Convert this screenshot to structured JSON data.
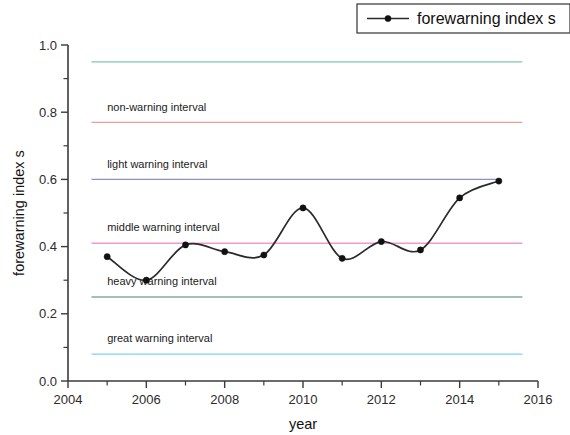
{
  "chart_data": {
    "type": "line",
    "title": "",
    "xlabel": "year",
    "ylabel": "forewarning index s",
    "xlim": [
      2004,
      2016
    ],
    "ylim": [
      0.0,
      1.0
    ],
    "xticks": [
      "2004",
      "2006",
      "2008",
      "2010",
      "2012",
      "2014",
      "2016"
    ],
    "yticks": [
      "0.0",
      "0.2",
      "0.4",
      "0.6",
      "0.8",
      "1.0"
    ],
    "grid": false,
    "legend_position": "top-right",
    "series": [
      {
        "name": "forewarning index s",
        "marker": "filled-circle",
        "color": "#2a2a2a",
        "x": [
          2005,
          2006,
          2007,
          2008,
          2009,
          2010,
          2011,
          2012,
          2013,
          2014,
          2015
        ],
        "values": [
          0.37,
          0.3,
          0.405,
          0.385,
          0.375,
          0.515,
          0.365,
          0.415,
          0.39,
          0.545,
          0.595
        ]
      }
    ],
    "threshold_lines": [
      {
        "label": "",
        "value": 0.95,
        "color": "#7fc6ac",
        "x_start": 2004.6,
        "x_end": 2015.6
      },
      {
        "label": "non-warning interval",
        "value": 0.77,
        "color": "#f09a9a",
        "x_start": 2004.6,
        "x_end": 2015.6
      },
      {
        "label": "light warning interval",
        "value": 0.6,
        "color": "#8a8fcf",
        "x_start": 2004.6,
        "x_end": 2015.0
      },
      {
        "label": "middle warning interval",
        "value": 0.41,
        "color": "#f49ac8",
        "x_start": 2004.6,
        "x_end": 2015.6
      },
      {
        "label": "heavy warning interval",
        "value": 0.25,
        "color": "#86a9a0",
        "x_start": 2004.6,
        "x_end": 2015.6
      },
      {
        "label": "great warning interval",
        "value": 0.08,
        "color": "#7fd3ee",
        "x_start": 2004.6,
        "x_end": 2015.6
      }
    ],
    "annotations": [
      {
        "text": "non-warning interval",
        "x": 2005.0,
        "y": 0.805
      },
      {
        "text": "light warning interval",
        "x": 2005.0,
        "y": 0.635
      },
      {
        "text": "middle warning interval",
        "x": 2005.0,
        "y": 0.445
      },
      {
        "text": "heavy warning interval",
        "x": 2005.0,
        "y": 0.285
      },
      {
        "text": "great warning interval",
        "x": 2005.0,
        "y": 0.115
      }
    ]
  },
  "legend": {
    "entries": [
      {
        "label": "forewarning index s"
      }
    ]
  },
  "axes": {
    "x_title": "year",
    "y_title": "forewarning index s"
  }
}
